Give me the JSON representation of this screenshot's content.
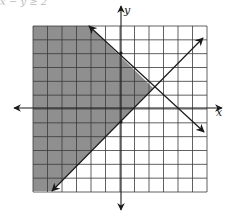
{
  "caption": "x − y ≥ 2",
  "graph": {
    "x_axis_label": "x",
    "y_axis_label": "y",
    "grid": {
      "x_min": -6,
      "x_max": 6,
      "y_min": -6,
      "y_max": 6,
      "step": 1
    },
    "lines": [
      {
        "name": "decreasing-boundary",
        "equation": "y = -x + 4",
        "style": "solid",
        "arrows": "both"
      },
      {
        "name": "increasing-boundary",
        "equation": "y = x - 1",
        "style": "solid",
        "arrows": "both"
      }
    ],
    "shaded_region": "above y = x - 1 and below y = -x + 4",
    "colors": {
      "shade": "#8f8f8f",
      "grid": "#3a3a3a",
      "axis": "#1a1a1a",
      "background": "#ffffff"
    }
  }
}
